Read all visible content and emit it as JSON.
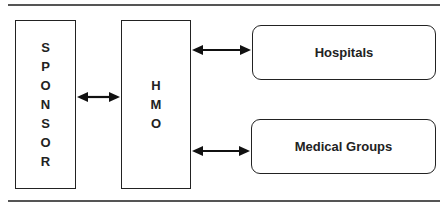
{
  "diagram": {
    "nodes": {
      "sponsor": {
        "letters": [
          "S",
          "P",
          "O",
          "N",
          "S",
          "O",
          "R"
        ],
        "label": "SPONSOR"
      },
      "hmo": {
        "letters": [
          "H",
          "M",
          "O"
        ],
        "label": "HMO"
      },
      "hospitals": {
        "label": "Hospitals"
      },
      "medical_groups": {
        "label": "Medical Groups"
      }
    },
    "edges": [
      {
        "from": "SPONSOR",
        "to": "HMO",
        "type": "bidirectional"
      },
      {
        "from": "HMO",
        "to": "Hospitals",
        "type": "bidirectional"
      },
      {
        "from": "HMO",
        "to": "Medical Groups",
        "type": "bidirectional"
      }
    ],
    "colors": {
      "stroke": "#222222",
      "rule": "#555555",
      "background": "#ffffff"
    }
  }
}
